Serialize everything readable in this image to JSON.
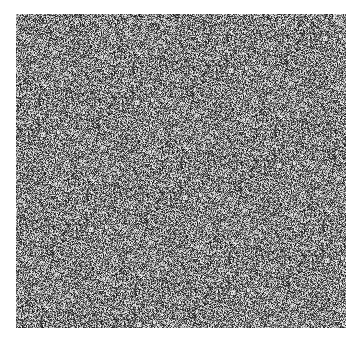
{
  "image": {
    "description": "grayscale random noise field",
    "region": {
      "x": 16,
      "y": 14,
      "width": 330,
      "height": 314
    },
    "background": "#ffffff",
    "tones": {
      "dark": "#1a1a1a",
      "light": "#f2f2f2"
    }
  }
}
